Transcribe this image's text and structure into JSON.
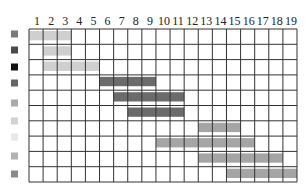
{
  "chart_data": {
    "type": "gantt",
    "title": "",
    "xlabel": "",
    "ylabel": "",
    "columns": [
      "1",
      "2",
      "3",
      "4",
      "5",
      "6",
      "7",
      "8",
      "9",
      "10",
      "11",
      "12",
      "13",
      "14",
      "15",
      "16",
      "17",
      "18",
      "19"
    ],
    "xlim": [
      1,
      19
    ],
    "grid": true,
    "legend_markers": [
      {
        "color": "#7a7a7a"
      },
      {
        "color": "#4a4a4a"
      },
      {
        "color": "#111111"
      },
      {
        "color": "#666666"
      },
      {
        "color": "#aaaaaa"
      },
      {
        "color": "#d2d2d2"
      },
      {
        "color": "#e8e8e8"
      },
      {
        "color": "#b2b2b2"
      },
      {
        "color": "#8a8a8a"
      }
    ],
    "rows": [
      {
        "start": 1,
        "end": 3,
        "color": "#cfcfcf"
      },
      {
        "start": 2,
        "end": 3,
        "color": "#cfcfcf"
      },
      {
        "start": 2,
        "end": 5,
        "color": "#cfcfcf"
      },
      {
        "start": 6,
        "end": 9,
        "color": "#6b6b6b"
      },
      {
        "start": 7,
        "end": 11,
        "color": "#6b6b6b"
      },
      {
        "start": 8,
        "end": 11,
        "color": "#6b6b6b"
      },
      {
        "start": 13,
        "end": 15,
        "color": "#a5a5a5"
      },
      {
        "start": 10,
        "end": 16,
        "color": "#a5a5a5"
      },
      {
        "start": 13,
        "end": 18,
        "color": "#a5a5a5"
      },
      {
        "start": 15,
        "end": 19,
        "color": "#a5a5a5"
      }
    ]
  }
}
